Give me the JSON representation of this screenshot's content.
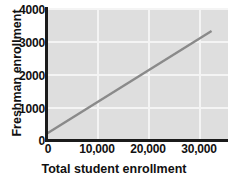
{
  "chart_data": {
    "type": "line",
    "title": "",
    "xlabel": "Total student enrollment",
    "ylabel": "Freshman enrollment",
    "xlim": [
      0,
      33000
    ],
    "ylim": [
      0,
      4000
    ],
    "grid": true,
    "legend": null,
    "x_ticks": [
      0,
      10000,
      20000,
      30000
    ],
    "x_tick_labels": [
      "0",
      "10,000",
      "20,000",
      "30,000"
    ],
    "y_ticks": [
      0,
      1000,
      2000,
      3000,
      4000
    ],
    "y_tick_labels": [
      "0",
      "1000",
      "2000",
      "3000",
      "4000"
    ],
    "series": [
      {
        "name": "regression-line",
        "x": [
          0,
          30000
        ],
        "values": [
          200,
          3300
        ],
        "color": "#8a8a8a"
      }
    ]
  },
  "style": {
    "panel_background": "#dedede",
    "gridline_color": "#f4f4f4",
    "axis_color": "#1b1b1b",
    "text_color": "#111111",
    "line_color": "#8a8a8a"
  }
}
